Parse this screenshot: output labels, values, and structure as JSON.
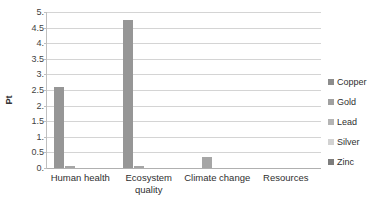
{
  "chart_data": {
    "type": "bar",
    "title": "",
    "xlabel": "",
    "ylabel": "Pt",
    "ylim": [
      0,
      5
    ],
    "ytick_step": 0.5,
    "grid": true,
    "legend_position": "right",
    "categories": [
      "Human health",
      "Ecosystem quality",
      "Climate change",
      "Resources"
    ],
    "ytick_labels": [
      "5.",
      "4.5",
      "4.",
      "3.5",
      "3.",
      "2.5",
      "2.",
      "1.5",
      "1.",
      "0.5",
      "0."
    ],
    "ytick_values": [
      5,
      4.5,
      4,
      3.5,
      3,
      2.5,
      2,
      1.5,
      1,
      0.5,
      0
    ],
    "series": [
      {
        "name": "Copper",
        "color": "#969696",
        "values": [
          2.6,
          4.75,
          0.0,
          0.0
        ]
      },
      {
        "name": "Gold",
        "color": "#a6a6a6",
        "values": [
          0.05,
          0.08,
          0.35,
          0.0
        ]
      },
      {
        "name": "Lead",
        "color": "#b0b0b0",
        "values": [
          0.0,
          0.0,
          0.0,
          0.0
        ]
      },
      {
        "name": "Silver",
        "color": "#d0d0d0",
        "values": [
          0.0,
          0.0,
          0.0,
          0.0
        ]
      },
      {
        "name": "Zinc",
        "color": "#8c8c8c",
        "values": [
          0.0,
          0.0,
          0.0,
          0.0
        ]
      }
    ]
  },
  "legend": {
    "items": [
      {
        "label": "Copper",
        "color": "#8c8c8c"
      },
      {
        "label": "Gold",
        "color": "#a0a0a0"
      },
      {
        "label": "Lead",
        "color": "#b4b4b4"
      },
      {
        "label": "Silver",
        "color": "#d2d2d2"
      },
      {
        "label": "Zinc",
        "color": "#7d7d7d"
      }
    ]
  },
  "caption": {
    "text": ""
  }
}
